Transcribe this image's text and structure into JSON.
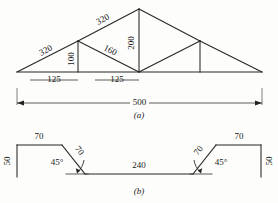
{
  "figure": {
    "background": "#fdfdfb",
    "line_color": "#262626"
  },
  "figure_a": {
    "caption": "(a)",
    "labels": {
      "rafter_lower_left": "320",
      "rafter_upper_left": "320",
      "post_left": "100",
      "diagonal_left": "160",
      "center_post": "200",
      "panel_left": "125",
      "panel_right": "125",
      "span": "500"
    }
  },
  "figure_b": {
    "caption": "(b)",
    "labels": {
      "flange_left": "70",
      "flange_right": "70",
      "web_left": "50",
      "web_right": "50",
      "bend_left": "70",
      "bend_right": "70",
      "angle_left": "45°",
      "angle_right": "45°",
      "base": "240"
    }
  }
}
